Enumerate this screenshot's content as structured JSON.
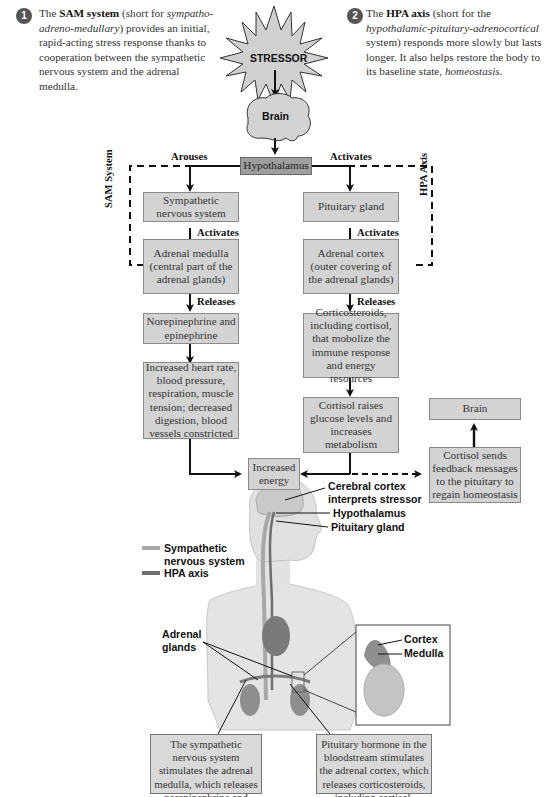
{
  "intro": {
    "sam": {
      "number": "1",
      "pre": "The ",
      "bold": "SAM system",
      "mid": " (short for ",
      "italic": "sympatho-adreno-medullary",
      "post": ") provides an initial, rapid-acting stress response thanks to cooperation between the sympathetic nervous system and the adrenal medulla."
    },
    "hpa": {
      "number": "2",
      "pre": "The ",
      "bold": "HPA axis",
      "mid": " (short for the ",
      "italic": "hypothalamic-pituitary-adrenocortical",
      "post": " system) responds more slowly but lasts longer. It also helps restore the body to its baseline state, ",
      "italic2": "homeostasis",
      "end": "."
    }
  },
  "flow": {
    "stressor": "STRESSOR",
    "brain": "Brain",
    "hypothalamus": "Hypothalamus",
    "arouses": "Arouses",
    "activates_top": "Activates",
    "sam_label": "SAM System",
    "hpa_label": "HPA Axis",
    "left": {
      "sympathetic": "Sympathetic nervous system",
      "activates": "Activates",
      "adrenal_medulla": "Adrenal medulla (central part of the adrenal glands)",
      "releases": "Releases",
      "norepinephrine": "Norepinephrine and epinephrine",
      "effects": "Increased heart rate, blood pressure, respiration, muscle tension; decreased digestion, blood vessels constricted"
    },
    "right": {
      "pituitary": "Pituitary gland",
      "activates": "Activates",
      "adrenal_cortex": "Adrenal cortex (outer covering of the adrenal glands)",
      "releases": "Releases",
      "corticosteroids": "Corticosteroids, including cortisol, that mobolize the immune response and energy resources",
      "cortisol_raises": "Cortisol raises glucose levels and increases metabolism"
    },
    "increased_energy": "Increased energy",
    "feedback": "Cortisol sends feedback messages to the pituitary to regain homeostasis",
    "brain_feedback": "Brain"
  },
  "anatomy": {
    "cerebral_cortex": "Cerebral cortex interprets stressor",
    "hypothalamus": "Hypothalamus",
    "pituitary": "Pituitary gland",
    "legend": [
      {
        "label": "Sympathetic nervous system",
        "color": "#a8a8a8"
      },
      {
        "label": "HPA axis",
        "color": "#6e6e6e"
      }
    ],
    "adrenal_glands": "Adrenal glands",
    "cortex": "Cortex",
    "medulla": "Medulla",
    "callout_left": "The sympathetic nervous system stimulates the adrenal medulla, which releases norepinephrine and epinephrine.",
    "callout_right": "Pituitary hormone in the bloodstream stimulates the adrenal cortex, which releases corticosteroids, including cortisol."
  }
}
